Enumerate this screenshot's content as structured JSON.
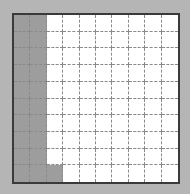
{
  "grid": {
    "rows": 10,
    "cols": 10,
    "shaded_count": 21,
    "total_cells": 100,
    "shaded_cells": [
      [
        0,
        0
      ],
      [
        1,
        0
      ],
      [
        2,
        0
      ],
      [
        3,
        0
      ],
      [
        4,
        0
      ],
      [
        5,
        0
      ],
      [
        6,
        0
      ],
      [
        7,
        0
      ],
      [
        8,
        0
      ],
      [
        9,
        0
      ],
      [
        0,
        1
      ],
      [
        1,
        1
      ],
      [
        2,
        1
      ],
      [
        3,
        1
      ],
      [
        4,
        1
      ],
      [
        5,
        1
      ],
      [
        6,
        1
      ],
      [
        7,
        1
      ],
      [
        8,
        1
      ],
      [
        9,
        1
      ],
      [
        9,
        2
      ]
    ],
    "colors": {
      "background": "#b5b5b5",
      "shaded": "#9d9d9d",
      "unshaded": "#ffffff",
      "border": "#3a3a3a",
      "gridline": "#8a8a8a"
    }
  }
}
